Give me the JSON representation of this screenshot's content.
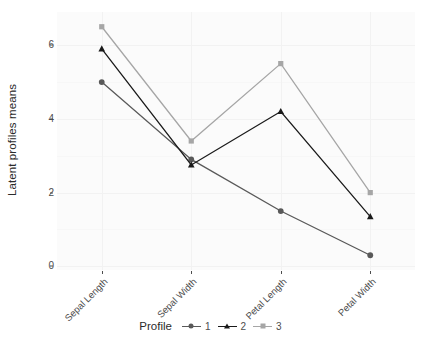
{
  "chart_data": {
    "type": "line",
    "title": "",
    "subtitle": "",
    "xlabel": "",
    "ylabel": "Latent profiles means",
    "categories": [
      "Sepal Length",
      "Sepal Width",
      "Petal Length",
      "Petal Width"
    ],
    "series": [
      {
        "name": "1",
        "values": [
          5.0,
          2.9,
          1.5,
          0.3
        ],
        "color": "#595959",
        "marker": "circle"
      },
      {
        "name": "2",
        "values": [
          5.9,
          2.75,
          4.2,
          1.35
        ],
        "color": "#1a1a1a",
        "marker": "triangle"
      },
      {
        "name": "3",
        "values": [
          6.5,
          3.4,
          5.5,
          2.0
        ],
        "color": "#a6a6a6",
        "marker": "square"
      }
    ],
    "ylim": [
      -0.1,
      6.9
    ],
    "yticks": [
      0,
      2,
      4,
      6
    ],
    "ytick_labels": [
      "0",
      "2",
      "4",
      "6"
    ],
    "grid": true,
    "legend_position": "bottom",
    "legend_title": "Profile",
    "panel_background": "#fbfbfb",
    "grid_color": "#f2f2f2"
  },
  "axes": {
    "y_title": "Latent profiles means",
    "y_tick_labels": [
      "6",
      "4",
      "2",
      "0"
    ],
    "x_tick_labels": [
      "Sepal Length",
      "Sepal Width",
      "Petal Length",
      "Petal Width"
    ]
  },
  "legend": {
    "title": "Profile",
    "items": [
      {
        "label": "1",
        "color": "#595959",
        "marker": "circle"
      },
      {
        "label": "2",
        "color": "#1a1a1a",
        "marker": "triangle"
      },
      {
        "label": "3",
        "color": "#a6a6a6",
        "marker": "square"
      }
    ]
  }
}
